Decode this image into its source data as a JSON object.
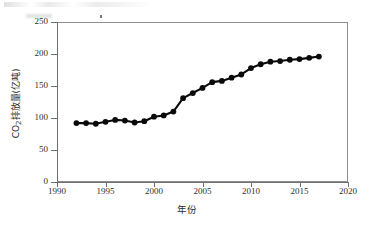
{
  "chart_data": {
    "type": "line",
    "title": "",
    "subtitle": "",
    "xlabel": "年份",
    "ylabel": "CO₂排放量(亿吨)",
    "ylabel_parts": {
      "prefix": "CO",
      "sub": "2",
      "suffix": "排放量(亿吨)"
    },
    "xlim": [
      1990,
      2020
    ],
    "ylim": [
      0,
      250
    ],
    "xticks": [
      1990,
      1995,
      2000,
      2005,
      2010,
      2015,
      2020
    ],
    "xtick_labels": [
      "1990",
      "1995",
      "2000",
      "2005",
      "2010",
      "2015",
      "2020"
    ],
    "yticks": [
      0,
      50,
      100,
      150,
      200,
      250
    ],
    "ytick_labels": [
      "0",
      "50",
      "100",
      "150",
      "200",
      "250"
    ],
    "grid": false,
    "legend": null,
    "marker": "filled-circle",
    "marker_color": "#0a0a0a",
    "line_color": "#0a0a0a",
    "x": [
      1992,
      1993,
      1994,
      1995,
      1996,
      1997,
      1998,
      1999,
      2000,
      2001,
      2002,
      2003,
      2004,
      2005,
      2006,
      2007,
      2008,
      2009,
      2010,
      2011,
      2012,
      2013,
      2014,
      2015,
      2016,
      2017
    ],
    "values": [
      92,
      92,
      91,
      94,
      97,
      96,
      93,
      95,
      102,
      104,
      110,
      131,
      139,
      147,
      156,
      158,
      163,
      168,
      178,
      184,
      188,
      189,
      191,
      192,
      194,
      196
    ],
    "series": [
      {
        "name": "CO₂排放量",
        "x": [
          1992,
          1993,
          1994,
          1995,
          1996,
          1997,
          1998,
          1999,
          2000,
          2001,
          2002,
          2003,
          2004,
          2005,
          2006,
          2007,
          2008,
          2009,
          2010,
          2011,
          2012,
          2013,
          2014,
          2015,
          2016,
          2017
        ],
        "values": [
          92,
          92,
          91,
          94,
          97,
          96,
          93,
          95,
          102,
          104,
          110,
          131,
          139,
          147,
          156,
          158,
          163,
          168,
          178,
          184,
          188,
          189,
          191,
          192,
          194,
          196
        ]
      }
    ]
  }
}
